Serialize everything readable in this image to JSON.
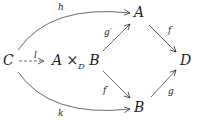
{
  "diagram": {
    "type": "commutative-diagram",
    "nodes": {
      "C": "C",
      "P_left": "A ×",
      "P_sub": "D",
      "P_right": "B",
      "A": "A",
      "B": "B",
      "D": "D"
    },
    "arrows": {
      "h": {
        "label": "h",
        "from": "C",
        "to": "A",
        "style": "curved-solid"
      },
      "k": {
        "label": "k",
        "from": "C",
        "to": "B",
        "style": "curved-solid"
      },
      "l": {
        "label": "l",
        "from": "C",
        "to": "A ×_D B",
        "style": "dashed"
      },
      "g_prime": {
        "label": "g′",
        "from": "A ×_D B",
        "to": "A",
        "style": "solid"
      },
      "f_prime": {
        "label": "f′",
        "from": "A ×_D B",
        "to": "B",
        "style": "solid"
      },
      "f": {
        "label": "f",
        "from": "A",
        "to": "D",
        "style": "solid"
      },
      "g": {
        "label": "g",
        "from": "B",
        "to": "D",
        "style": "solid"
      }
    }
  }
}
